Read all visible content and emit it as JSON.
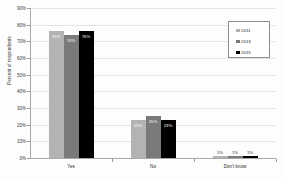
{
  "chart_data": {
    "type": "bar",
    "title": "",
    "subtitle": "",
    "xlabel": "",
    "ylabel": "Percent of respondents",
    "ylim": [
      0,
      90
    ],
    "ytick_labels": [
      "0%",
      "10%",
      "20%",
      "30%",
      "40%",
      "50%",
      "60%",
      "70%",
      "80%",
      "90%"
    ],
    "ytick_values": [
      0,
      10,
      20,
      30,
      40,
      50,
      60,
      70,
      80,
      90
    ],
    "grid": true,
    "legend_position": "upper-right",
    "categories": [
      "Yes",
      "No",
      "Don't know"
    ],
    "series": [
      {
        "name": "2011",
        "color": "#b3b3b3",
        "values": [
          76,
          23,
          1
        ],
        "labels": [
          "76%",
          "23%",
          "1%"
        ]
      },
      {
        "name": "2013",
        "color": "#7a7a7a",
        "values": [
          74,
          25,
          1
        ],
        "labels": [
          "74%",
          "25%",
          "1%"
        ]
      },
      {
        "name": "2015",
        "color": "#000000",
        "values": [
          76,
          23,
          1
        ],
        "labels": [
          "76%",
          "23%",
          "1%"
        ]
      }
    ]
  },
  "legend": {
    "entries": [
      {
        "label": "2011",
        "color": "#b3b3b3"
      },
      {
        "label": "2013",
        "color": "#7a7a7a"
      },
      {
        "label": "2015",
        "color": "#000000"
      }
    ]
  },
  "axes": {
    "y_title": "Percent of respondents"
  }
}
